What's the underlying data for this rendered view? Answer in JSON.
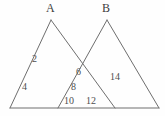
{
  "figure": {
    "stroke_color": "#6e6e6e",
    "background_color": "#fefefe",
    "vertex_labels": [
      {
        "name": "apex-a",
        "text": "A",
        "x": 46,
        "y": 2
      },
      {
        "name": "apex-b",
        "text": "B",
        "x": 102,
        "y": 2
      }
    ],
    "angle_labels": [
      {
        "name": "angle-2",
        "text": "2",
        "x": 32,
        "y": 54
      },
      {
        "name": "angle-4",
        "text": "4",
        "x": 22,
        "y": 82
      },
      {
        "name": "angle-6",
        "text": "6",
        "x": 76,
        "y": 67
      },
      {
        "name": "angle-8",
        "text": "8",
        "x": 71,
        "y": 82
      },
      {
        "name": "angle-10",
        "text": "10",
        "x": 64,
        "y": 96
      },
      {
        "name": "angle-12",
        "text": "12",
        "x": 86,
        "y": 96
      },
      {
        "name": "angle-14",
        "text": "14",
        "x": 110,
        "y": 72
      }
    ],
    "geometry": {
      "baseline": {
        "x1": 10,
        "y1": 108,
        "x2": 159,
        "y2": 108
      },
      "triangle_a": {
        "apex_x": 51,
        "apex_y": 20,
        "left_x": 10,
        "left_y": 108,
        "right_x": 115,
        "right_y": 108
      },
      "triangle_b": {
        "apex_x": 107,
        "apex_y": 20,
        "left_x": 58,
        "left_y": 108,
        "right_x": 159,
        "right_y": 108
      },
      "intersection": {
        "x": 80,
        "y": 63
      }
    }
  }
}
